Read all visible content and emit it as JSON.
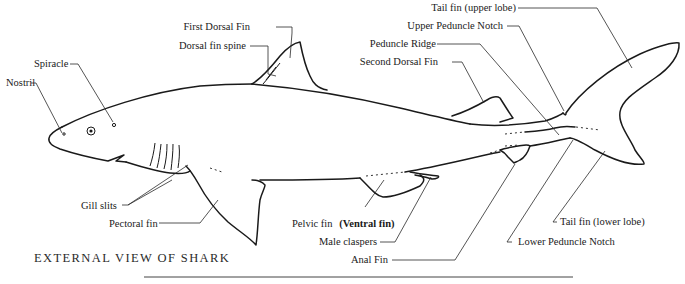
{
  "diagram": {
    "caption": "EXTERNAL VIEW OF SHARK",
    "labels": {
      "first_dorsal_fin": "First Dorsal Fin",
      "dorsal_fin_spine": "Dorsal fin spine",
      "spiracle": "Spiracle",
      "nostril": "Nostril",
      "second_dorsal_fin": "Second Dorsal Fin",
      "peduncle_ridge": "Peduncle Ridge",
      "upper_peduncle_notch": "Upper Peduncle Notch",
      "tail_fin_upper": "Tail fin (upper lobe)",
      "gill_slits": "Gill slits",
      "pectoral_fin": "Pectoral fin",
      "pelvic_fin": "Pelvic fin",
      "pelvic_fin_alt": "(Ventral fin)",
      "male_claspers": "Male claspers",
      "anal_fin": "Anal Fin",
      "lower_peduncle_notch": "Lower Peduncle Notch",
      "tail_fin_lower": "Tail fin (lower lobe)"
    }
  }
}
